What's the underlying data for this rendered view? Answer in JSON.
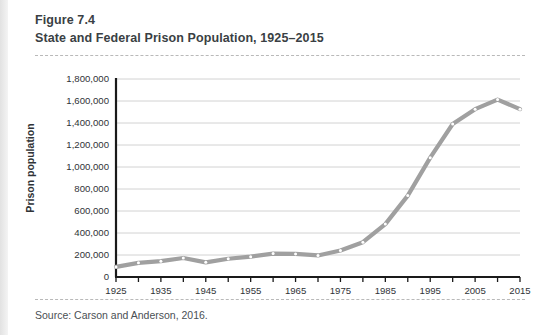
{
  "figure": {
    "number_label": "Figure 7.4",
    "title": "State and Federal Prison Population, 1925–2015",
    "source": "Source: Carson and Anderson, 2016."
  },
  "colors": {
    "line": "#a0a0a0",
    "marker_fill": "#ffffff",
    "axis": "#1a1a1a",
    "gridline": "#d2d2d2",
    "text": "#2f3337",
    "page_background": "#ffffff"
  },
  "chart_data": {
    "type": "line",
    "title": "State and Federal Prison Population, 1925–2015",
    "xlabel": "",
    "ylabel": "Prison population",
    "xlim": [
      1925,
      2015
    ],
    "ylim": [
      0,
      1800000
    ],
    "grid": true,
    "legend": "none",
    "y_ticks": [
      0,
      200000,
      400000,
      600000,
      800000,
      1000000,
      1200000,
      1400000,
      1600000,
      1800000
    ],
    "y_tick_labels": [
      "0",
      "200,000",
      "400,000",
      "600,000",
      "800,000",
      "1,000,000",
      "1,200,000",
      "1,400,000",
      "1,600,000",
      "1,800,000"
    ],
    "x_ticks": [
      1925,
      1930,
      1935,
      1940,
      1945,
      1950,
      1955,
      1960,
      1965,
      1970,
      1975,
      1980,
      1985,
      1990,
      1995,
      2000,
      2005,
      2010,
      2015
    ],
    "x_tick_labels": [
      "1925",
      "",
      "1935",
      "",
      "1945",
      "",
      "1955",
      "",
      "1965",
      "",
      "1975",
      "",
      "1985",
      "",
      "1995",
      "",
      "2005",
      "",
      "2015"
    ],
    "x": [
      1925,
      1930,
      1935,
      1940,
      1945,
      1950,
      1955,
      1960,
      1965,
      1970,
      1975,
      1980,
      1985,
      1990,
      1995,
      2000,
      2005,
      2010,
      2015
    ],
    "values": [
      92000,
      129000,
      144000,
      173000,
      133000,
      166000,
      185000,
      213000,
      210000,
      196000,
      241000,
      316000,
      481000,
      740000,
      1085000,
      1391000,
      1526000,
      1613000,
      1526000
    ],
    "series": [
      {
        "name": "State and Federal Prison Population",
        "values": [
          92000,
          129000,
          144000,
          173000,
          133000,
          166000,
          185000,
          213000,
          210000,
          196000,
          241000,
          316000,
          481000,
          740000,
          1085000,
          1391000,
          1526000,
          1613000,
          1526000
        ]
      }
    ]
  }
}
